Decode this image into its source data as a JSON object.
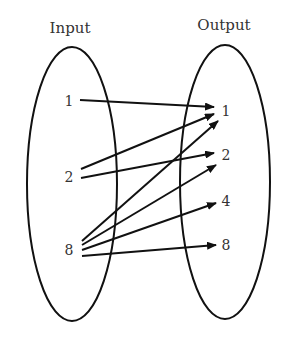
{
  "diagram": {
    "type": "mapping-diagram",
    "input_set": {
      "title": "Input",
      "values": [
        {
          "label": "1",
          "x": 69,
          "y": 101
        },
        {
          "label": "2",
          "x": 69,
          "y": 177
        },
        {
          "label": "8",
          "x": 69,
          "y": 250
        }
      ]
    },
    "output_set": {
      "title": "Output",
      "values": [
        {
          "label": "1",
          "x": 224,
          "y": 111
        },
        {
          "label": "2",
          "x": 224,
          "y": 155
        },
        {
          "label": "4",
          "x": 224,
          "y": 201
        },
        {
          "label": "8",
          "x": 224,
          "y": 245
        }
      ]
    },
    "mappings": [
      {
        "from": "1",
        "to": "1"
      },
      {
        "from": "2",
        "to": "1"
      },
      {
        "from": "2",
        "to": "2"
      },
      {
        "from": "8",
        "to": "1"
      },
      {
        "from": "8",
        "to": "2"
      },
      {
        "from": "8",
        "to": "4"
      },
      {
        "from": "8",
        "to": "8"
      }
    ],
    "colors": {
      "stroke": "#111111",
      "text": "#333333",
      "background": "#ffffff"
    }
  }
}
